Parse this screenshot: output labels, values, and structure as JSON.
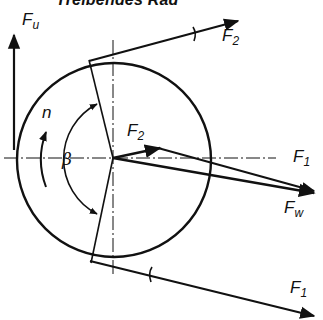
{
  "title": "Treibendes Rad",
  "labels": {
    "fu": {
      "main": "F",
      "sub": "u"
    },
    "f2_top": {
      "main": "F",
      "sub": "2"
    },
    "f2_center": {
      "main": "F",
      "sub": "2"
    },
    "f1_right": {
      "main": "F",
      "sub": "1"
    },
    "fw": {
      "main": "F",
      "sub": "w"
    },
    "f1_bottom": {
      "main": "F",
      "sub": "1"
    },
    "n": "n",
    "beta": "β"
  },
  "colors": {
    "stroke": "#111111",
    "background": "#ffffff"
  },
  "geometry": {
    "wheel_center": [
      113,
      158
    ],
    "wheel_radius": 98
  }
}
